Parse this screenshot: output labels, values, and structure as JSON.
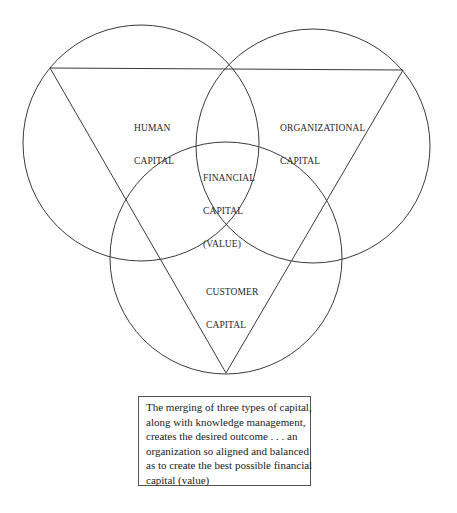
{
  "diagram": {
    "title": "",
    "circles": [
      {
        "id": "human",
        "label_lines": [
          "HUMAN",
          "CAPITAL"
        ],
        "cx": 141,
        "cy": 143,
        "r": 118
      },
      {
        "id": "organizational",
        "label_lines": [
          "ORGANIZATIONAL",
          "CAPITAL"
        ],
        "cx": 313,
        "cy": 146,
        "r": 117
      },
      {
        "id": "customer",
        "label_lines": [
          "CUSTOMER",
          "CAPITAL"
        ],
        "cx": 226,
        "cy": 258,
        "r": 116
      }
    ],
    "center_label_lines": [
      "FINANCIAL",
      "CAPITAL",
      "(VALUE)"
    ],
    "triangle": {
      "points": [
        [
          50,
          68
        ],
        [
          403,
          70
        ],
        [
          226,
          373
        ]
      ],
      "orientation": "inverted"
    },
    "stroke_color": "#3a3a3a"
  },
  "labels": {
    "human": {
      "line1": "HUMAN",
      "line2": "CAPITAL"
    },
    "organizational": {
      "line1": "ORGANIZATIONAL",
      "line2": "CAPITAL"
    },
    "financial": {
      "line1": "FINANCIAL",
      "line2": "CAPITAL",
      "line3": "(VALUE)"
    },
    "customer": {
      "line1": "CUSTOMER",
      "line2": "CAPITAL"
    }
  },
  "caption": {
    "lines": [
      "The merging of three types of capital,",
      "along with knowledge management,",
      "creates the desired outcome . . . an",
      "organization so aligned and balanced",
      "as to create the best possible financial",
      "capital (value)"
    ]
  }
}
